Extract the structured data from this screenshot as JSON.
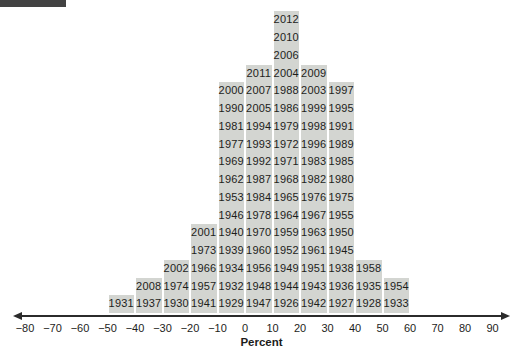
{
  "decor": {
    "top_left_bar_color": "#424242"
  },
  "chart_data": {
    "type": "bar",
    "subtype": "stacked-year-return-histogram",
    "title": "",
    "xlabel": "Percent",
    "ylabel": "",
    "xlim": [
      -80,
      90
    ],
    "x_ticks": [
      -80,
      -70,
      -60,
      -50,
      -40,
      -30,
      -20,
      -10,
      0,
      10,
      20,
      30,
      40,
      50,
      60,
      70,
      80,
      90
    ],
    "bin_width": 10,
    "grid": false,
    "legend": null,
    "bins": [
      {
        "range": [
          -50,
          -40
        ],
        "count": 1,
        "years": [
          "1931"
        ]
      },
      {
        "range": [
          -40,
          -30
        ],
        "count": 2,
        "years": [
          "1937",
          "2008"
        ]
      },
      {
        "range": [
          -30,
          -20
        ],
        "count": 3,
        "years": [
          "1930",
          "1974",
          "2002"
        ]
      },
      {
        "range": [
          -20,
          -10
        ],
        "count": 5,
        "years": [
          "1941",
          "1957",
          "1966",
          "1973",
          "2001"
        ]
      },
      {
        "range": [
          -10,
          0
        ],
        "count": 13,
        "years": [
          "1929",
          "1932",
          "1934",
          "1939",
          "1940",
          "1946",
          "1953",
          "1962",
          "1969",
          "1977",
          "1981",
          "1990",
          "2000"
        ]
      },
      {
        "range": [
          0,
          10
        ],
        "count": 14,
        "years": [
          "1947",
          "1948",
          "1956",
          "1960",
          "1970",
          "1978",
          "1984",
          "1987",
          "1992",
          "1993",
          "1994",
          "2005",
          "2007",
          "2011"
        ]
      },
      {
        "range": [
          10,
          20
        ],
        "count": 17,
        "years": [
          "1926",
          "1944",
          "1949",
          "1952",
          "1959",
          "1964",
          "1965",
          "1968",
          "1971",
          "1972",
          "1979",
          "1986",
          "1988",
          "2004",
          "2006",
          "2010",
          "2012"
        ]
      },
      {
        "range": [
          20,
          30
        ],
        "count": 14,
        "years": [
          "1942",
          "1943",
          "1951",
          "1961",
          "1963",
          "1967",
          "1976",
          "1982",
          "1983",
          "1996",
          "1998",
          "1999",
          "2003",
          "2009"
        ]
      },
      {
        "range": [
          30,
          40
        ],
        "count": 13,
        "years": [
          "1927",
          "1936",
          "1938",
          "1945",
          "1950",
          "1955",
          "1975",
          "1980",
          "1985",
          "1989",
          "1991",
          "1995",
          "1997"
        ]
      },
      {
        "range": [
          40,
          50
        ],
        "count": 3,
        "years": [
          "1928",
          "1935",
          "1958"
        ]
      },
      {
        "range": [
          50,
          60
        ],
        "count": 2,
        "years": [
          "1933",
          "1954"
        ]
      }
    ],
    "style": {
      "cell_bg": "#d3d5d1",
      "cell_text": "#1d1d1b",
      "axis_color": "#2b2b2b"
    },
    "note_years_order": "years listed bottom-to-top within each bin"
  }
}
